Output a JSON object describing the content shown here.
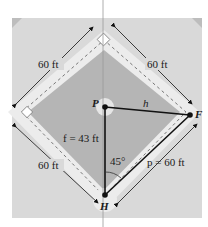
{
  "figure": {
    "points": {
      "P": "P",
      "F": "F",
      "H": "H"
    },
    "labels": {
      "top_left_side": "60 ft",
      "top_right_side": "60 ft",
      "bottom_left_side": "60 ft",
      "h": "h",
      "f": "f = 43 ft",
      "p": "p = 60 ft",
      "angle": "45°"
    },
    "colors": {
      "field": "#c9c9c9",
      "infield": "#b3b3b3",
      "baseline_path": "#e6e6e6",
      "outer": "#dedede",
      "line": "#111111"
    }
  }
}
